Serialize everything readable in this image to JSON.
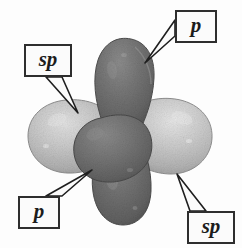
{
  "figure": {
    "background_color": "#fdfdfd",
    "width": 242,
    "height": 248
  },
  "labels": {
    "p_top_right": "p",
    "sp_top_left": "sp",
    "p_bottom_left": "p",
    "sp_bottom_right": "sp"
  },
  "orbitals": [
    {
      "name": "p-orbital-upper-lobe",
      "label": "p",
      "orientation": "vertical-up",
      "color": "#6f6f6f",
      "highlight_color": "#8d8d8d",
      "shadow_color": "#4e4e4e"
    },
    {
      "name": "p-orbital-lower-lobe",
      "label": "p",
      "orientation": "vertical-down",
      "color": "#6f6f6f",
      "highlight_color": "#8a8a8a",
      "shadow_color": "#4b4b4b"
    },
    {
      "name": "sp-orbital-left-lobe",
      "label": "sp",
      "orientation": "horizontal-left",
      "color": "#b9b9b9",
      "highlight_color": "#d8d8d8",
      "shadow_color": "#9a9a9a"
    },
    {
      "name": "sp-orbital-right-lobe",
      "label": "sp",
      "orientation": "horizontal-right",
      "color": "#bcbcbc",
      "highlight_color": "#dcdcdc",
      "shadow_color": "#9d9d9d"
    }
  ],
  "colors": {
    "p_orbital": "#6f6f6f",
    "sp_orbital": "#bcbcbc",
    "callout_border": "#2e2e2e",
    "leader_line": "#1f1f1f",
    "background": "#fdfdfd",
    "text": "#1c1c1c"
  },
  "leaders": [
    {
      "name": "leader-p-top-right",
      "from_label": "p",
      "points_to": "p-orbital-upper-lobe"
    },
    {
      "name": "leader-sp-top-left",
      "from_label": "sp",
      "points_to": "sp-orbital-left-lobe"
    },
    {
      "name": "leader-p-bottom-left",
      "from_label": "p",
      "points_to": "p-orbital-lower-lobe"
    },
    {
      "name": "leader-sp-bottom-right",
      "from_label": "sp",
      "points_to": "sp-orbital-right-lobe"
    }
  ]
}
